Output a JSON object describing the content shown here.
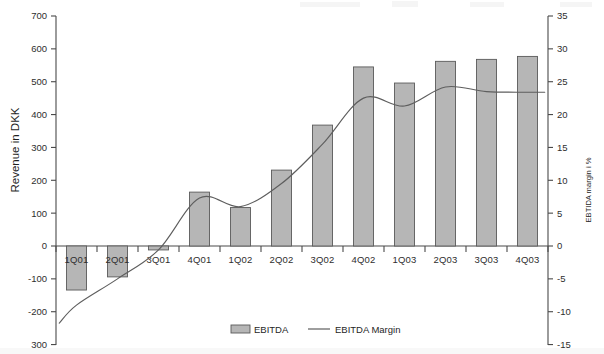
{
  "chart_data": {
    "type": "bar",
    "title": "",
    "subtitle": "",
    "xlabel": "",
    "ylabel": "Revenue in DKK",
    "y2label": "EBTIDA margin i %",
    "categories": [
      "1Q01",
      "2Q01",
      "3Q01",
      "4Q01",
      "1Q02",
      "2Q02",
      "3Q02",
      "4Q02",
      "1Q03",
      "2Q03",
      "3Q03",
      "4Q03"
    ],
    "ylim": [
      -300,
      700
    ],
    "yticks": [
      700,
      600,
      500,
      400,
      300,
      200,
      100,
      0,
      -100,
      -200,
      -300
    ],
    "ytick_labels": [
      "700",
      "600",
      "500",
      "400",
      "300",
      "200",
      "100",
      "0",
      "-100",
      "-200",
      "300"
    ],
    "y2lim": [
      -15,
      35
    ],
    "y2ticks": [
      35,
      30,
      25,
      20,
      15,
      10,
      5,
      0,
      -5,
      -10,
      -15
    ],
    "y2tick_labels": [
      "35",
      "30",
      "25",
      "20",
      "15",
      "10",
      "5",
      "0",
      "-5",
      "-10",
      "-15"
    ],
    "grid": false,
    "legend_position": "bottom",
    "series": [
      {
        "name": "EBITDA",
        "type": "bar",
        "axis": "left",
        "unit": "DKK",
        "color": "#b6b6b6",
        "values": [
          -134,
          -94,
          -12,
          164,
          117,
          231,
          368,
          545,
          496,
          562,
          568,
          577
        ]
      },
      {
        "name": "EBITDA Margin",
        "type": "line",
        "axis": "right",
        "unit": "%",
        "color": "#5e5e5e",
        "values": [
          -9.0,
          -5.0,
          -0.6,
          7.3,
          6.0,
          9.5,
          15.5,
          22.5,
          21.3,
          24.2,
          23.5,
          23.4
        ]
      }
    ]
  },
  "legend": {
    "items": [
      {
        "label": "EBITDA",
        "marker": "swatch"
      },
      {
        "label": "EBITDA Margin",
        "marker": "line"
      }
    ]
  }
}
